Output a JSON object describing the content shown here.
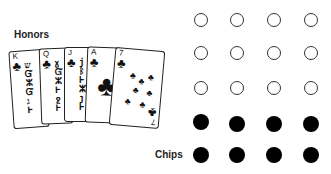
{
  "labels": {
    "honors": "Honors",
    "chips": "Chips"
  },
  "cards": [
    {
      "rank": "K",
      "suit": "♣",
      "type": "face",
      "art": "ש\nᏆ\nⵣ\nⱵ\nג"
    },
    {
      "rank": "Q",
      "suit": "♣",
      "type": "face",
      "art": "ɣ\nⱯ\nⵣ\nⱵ\nջ"
    },
    {
      "rank": "J",
      "suit": "♣",
      "type": "face",
      "art": "j\nᛒ\nⱵ\nⵣ\nȷ"
    },
    {
      "rank": "A",
      "suit": "♣",
      "type": "ace"
    },
    {
      "rank": "7",
      "suit": "♣",
      "type": "pips"
    }
  ],
  "chips_grid": {
    "rows": [
      [
        "empty",
        "empty",
        "empty",
        "empty"
      ],
      [
        "empty",
        "empty",
        "empty",
        "empty"
      ],
      [
        "empty",
        "empty",
        "empty",
        "empty"
      ],
      [
        "filled",
        "filled",
        "filled",
        "filled"
      ],
      [
        "filled",
        "filled",
        "filled",
        "filled"
      ]
    ]
  },
  "colors": {
    "ink": "#000000",
    "background": "#ffffff"
  }
}
